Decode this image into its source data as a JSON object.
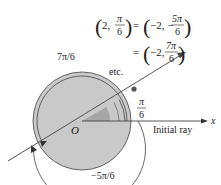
{
  "equation": {
    "line1_lhs_open": "(",
    "line1_lhs_r": "2,",
    "line1_lhs_num": "π",
    "line1_lhs_den": "6",
    "equals": "=",
    "line1_rhs_r": "−2, −",
    "line1_rhs_num": "5π",
    "line1_rhs_den": "6",
    "line2_rhs_r": "−2,",
    "line2_rhs_num": "7π",
    "line2_rhs_den": "6",
    "etc": "etc."
  },
  "labels": {
    "origin": "O",
    "angle_top_label": "7π/6",
    "angle_bottom_label": "−5π/6",
    "small_angle_num": "π",
    "small_angle_den": "6",
    "initial_ray": "Initial ray",
    "x_axis": "x"
  },
  "colors": {
    "disk_fill": "#c8c8c8",
    "wedge_fill": "#a9a9a9",
    "light_wedge_fill": "#e2e2e2",
    "stroke": "#3a3a3a"
  }
}
